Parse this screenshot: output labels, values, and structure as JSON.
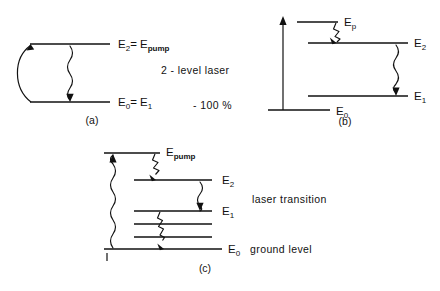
{
  "figure": {
    "background_color": "#ffffff",
    "ink_color": "#111111",
    "panels": [
      {
        "id": "a",
        "caption": "(a)",
        "description": "Two level laser scheme",
        "note_primary": "2 - level  laser",
        "note_secondary": "- 100 %",
        "levels": [
          {
            "key": "upper",
            "label_main": "E",
            "label_sub": "2",
            "label_tail": "= E",
            "label_tail_sub": "pump",
            "text": "E2 = Epump"
          },
          {
            "key": "lower",
            "label_main": "E",
            "label_sub": "0",
            "label_tail": "= E",
            "label_tail_sub": "1",
            "text": "E0 = E1"
          }
        ],
        "arrows": [
          {
            "name": "pump-curved-arrow",
            "direction": "up",
            "style": "curved"
          },
          {
            "name": "emission-wavy-arrow",
            "direction": "down",
            "style": "wavy"
          }
        ]
      },
      {
        "id": "b",
        "caption": "(b)",
        "description": "Three level laser scheme",
        "levels": [
          {
            "key": "pump",
            "label_main": "E",
            "label_sub": "p",
            "text": "Ep"
          },
          {
            "key": "upper",
            "label_main": "E",
            "label_sub": "2",
            "text": "E2"
          },
          {
            "key": "lower",
            "label_main": "E",
            "label_sub": "1",
            "text": "E1"
          },
          {
            "key": "ground",
            "label_main": "E",
            "label_sub": "0",
            "text": "E0"
          }
        ],
        "arrows": [
          {
            "name": "pump-vertical-arrow",
            "direction": "up",
            "style": "straight"
          },
          {
            "name": "relaxation-zigzag-arrow",
            "direction": "down",
            "style": "zigzag"
          },
          {
            "name": "laser-wavy-arrow",
            "direction": "down",
            "style": "wavy"
          }
        ]
      },
      {
        "id": "c",
        "caption": "(c)",
        "description": "Four level laser scheme",
        "note_laser": "laser  transition",
        "note_ground": "ground  level",
        "levels": [
          {
            "key": "pump",
            "label_main": "E",
            "label_sub": "pump",
            "text": "Epump"
          },
          {
            "key": "upper",
            "label_main": "E",
            "label_sub": "2",
            "text": "E2"
          },
          {
            "key": "lower",
            "label_main": "E",
            "label_sub": "1",
            "text": "E1"
          },
          {
            "key": "intermediate_1",
            "label_main": "",
            "label_sub": "",
            "text": ""
          },
          {
            "key": "intermediate_2",
            "label_main": "",
            "label_sub": "",
            "text": ""
          },
          {
            "key": "ground",
            "label_main": "E",
            "label_sub": "0",
            "text": "E0"
          }
        ],
        "arrows": [
          {
            "name": "pump-wavy-arrow",
            "direction": "up",
            "style": "wavy"
          },
          {
            "name": "relaxation-top-zigzag-arrow",
            "direction": "down",
            "style": "zigzag"
          },
          {
            "name": "laser-wavy-arrow",
            "direction": "down",
            "style": "wavy"
          },
          {
            "name": "relaxation-bottom-zigzag-arrow",
            "direction": "down",
            "style": "zigzag"
          }
        ],
        "tick_mark": "|"
      }
    ]
  }
}
